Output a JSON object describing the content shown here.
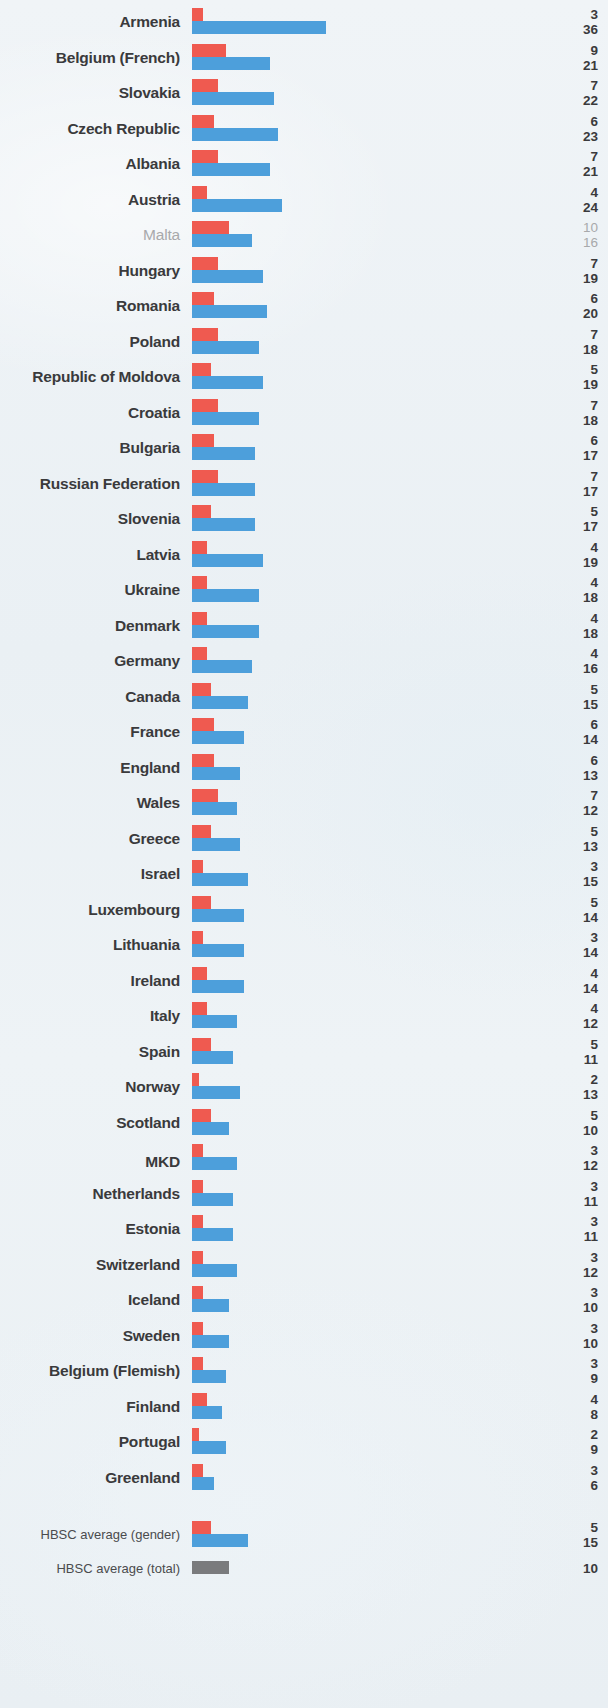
{
  "chart_data": {
    "type": "bar",
    "orientation": "horizontal",
    "title": "",
    "subtitle": "",
    "xlabel": "",
    "ylabel": "",
    "grid": false,
    "legend_position": "none",
    "series": [
      {
        "name": "boys",
        "color": "#ef5a50"
      },
      {
        "name": "girls",
        "color": "#4d9fdb"
      },
      {
        "name": "total",
        "color": "#7a7b7d"
      }
    ],
    "value_unit": "%",
    "xlim": [
      0,
      36
    ],
    "px_per_unit": 3.73,
    "categories": [
      "Armenia",
      "Belgium (French)",
      "Slovakia",
      "Czech Republic",
      "Albania",
      "Austria",
      "Malta",
      "Hungary",
      "Romania",
      "Poland",
      "Republic of Moldova",
      "Croatia",
      "Bulgaria",
      "Russian Federation",
      "Slovenia",
      "Latvia",
      "Ukraine",
      "Denmark",
      "Germany",
      "Canada",
      "France",
      "England",
      "Wales",
      "Greece",
      "Israel",
      "Luxembourg",
      "Lithuania",
      "Ireland",
      "Italy",
      "Spain",
      "Norway",
      "Scotland",
      "MKD",
      "Netherlands",
      "Estonia",
      "Switzerland",
      "Iceland",
      "Sweden",
      "Belgium (Flemish)",
      "Finland",
      "Portugal",
      "Greenland",
      "HBSC average (gender)",
      "HBSC average (total)"
    ],
    "boys": [
      3,
      9,
      7,
      6,
      7,
      4,
      10,
      7,
      6,
      7,
      5,
      7,
      6,
      7,
      5,
      4,
      4,
      4,
      4,
      5,
      6,
      6,
      7,
      5,
      3,
      5,
      3,
      4,
      4,
      5,
      2,
      5,
      3,
      3,
      3,
      3,
      3,
      3,
      3,
      4,
      2,
      3,
      5,
      null
    ],
    "girls": [
      36,
      21,
      22,
      23,
      21,
      24,
      16,
      19,
      20,
      18,
      19,
      18,
      17,
      17,
      17,
      19,
      18,
      18,
      16,
      15,
      14,
      13,
      12,
      13,
      15,
      14,
      14,
      14,
      12,
      11,
      13,
      10,
      12,
      11,
      11,
      12,
      10,
      10,
      9,
      8,
      9,
      6,
      15,
      null
    ],
    "total": [
      null,
      null,
      null,
      null,
      null,
      null,
      null,
      null,
      null,
      null,
      null,
      null,
      null,
      null,
      null,
      null,
      null,
      null,
      null,
      null,
      null,
      null,
      null,
      null,
      null,
      null,
      null,
      null,
      null,
      null,
      null,
      null,
      null,
      null,
      null,
      null,
      null,
      null,
      null,
      null,
      null,
      null,
      null,
      10
    ]
  },
  "rows": [
    {
      "label": "Armenia",
      "boys": "3",
      "girls": "36",
      "style": "normal"
    },
    {
      "label": "Belgium (French)",
      "boys": "9",
      "girls": "21",
      "style": "normal"
    },
    {
      "label": "Slovakia",
      "boys": "7",
      "girls": "22",
      "style": "normal"
    },
    {
      "label": "Czech Republic",
      "boys": "6",
      "girls": "23",
      "style": "normal"
    },
    {
      "label": "Albania",
      "boys": "7",
      "girls": "21",
      "style": "normal"
    },
    {
      "label": "Austria",
      "boys": "4",
      "girls": "24",
      "style": "normal"
    },
    {
      "label": "Malta",
      "boys": "10",
      "girls": "16",
      "style": "dim"
    },
    {
      "label": "Hungary",
      "boys": "7",
      "girls": "19",
      "style": "normal"
    },
    {
      "label": "Romania",
      "boys": "6",
      "girls": "20",
      "style": "normal"
    },
    {
      "label": "Poland",
      "boys": "7",
      "girls": "18",
      "style": "normal"
    },
    {
      "label": "Republic of Moldova",
      "boys": "5",
      "girls": "19",
      "style": "normal"
    },
    {
      "label": "Croatia",
      "boys": "7",
      "girls": "18",
      "style": "normal"
    },
    {
      "label": "Bulgaria",
      "boys": "6",
      "girls": "17",
      "style": "normal"
    },
    {
      "label": "Russian Federation",
      "boys": "7",
      "girls": "17",
      "style": "normal"
    },
    {
      "label": "Slovenia",
      "boys": "5",
      "girls": "17",
      "style": "normal"
    },
    {
      "label": "Latvia",
      "boys": "4",
      "girls": "19",
      "style": "normal"
    },
    {
      "label": "Ukraine",
      "boys": "4",
      "girls": "18",
      "style": "normal"
    },
    {
      "label": "Denmark",
      "boys": "4",
      "girls": "18",
      "style": "normal"
    },
    {
      "label": "Germany",
      "boys": "4",
      "girls": "16",
      "style": "normal"
    },
    {
      "label": "Canada",
      "boys": "5",
      "girls": "15",
      "style": "normal"
    },
    {
      "label": "France",
      "boys": "6",
      "girls": "14",
      "style": "normal"
    },
    {
      "label": "England",
      "boys": "6",
      "girls": "13",
      "style": "normal"
    },
    {
      "label": "Wales",
      "boys": "7",
      "girls": "12",
      "style": "normal"
    },
    {
      "label": "Greece",
      "boys": "5",
      "girls": "13",
      "style": "normal"
    },
    {
      "label": "Israel",
      "boys": "3",
      "girls": "15",
      "style": "normal"
    },
    {
      "label": "Luxembourg",
      "boys": "5",
      "girls": "14",
      "style": "normal"
    },
    {
      "label": "Lithuania",
      "boys": "3",
      "girls": "14",
      "style": "normal"
    },
    {
      "label": "Ireland",
      "boys": "4",
      "girls": "14",
      "style": "normal"
    },
    {
      "label": "Italy",
      "boys": "4",
      "girls": "12",
      "style": "normal"
    },
    {
      "label": "Spain",
      "boys": "5",
      "girls": "11",
      "style": "normal"
    },
    {
      "label": "Norway",
      "boys": "2",
      "girls": "13",
      "style": "normal"
    },
    {
      "label": "Scotland",
      "boys": "5",
      "girls": "10",
      "style": "normal"
    },
    {
      "label": "MKD",
      "boys": "3",
      "girls": "12",
      "style": "normal",
      "superscript": "a"
    },
    {
      "label": "Netherlands",
      "boys": "3",
      "girls": "11",
      "style": "normal"
    },
    {
      "label": "Estonia",
      "boys": "3",
      "girls": "11",
      "style": "normal"
    },
    {
      "label": "Switzerland",
      "boys": "3",
      "girls": "12",
      "style": "normal"
    },
    {
      "label": "Iceland",
      "boys": "3",
      "girls": "10",
      "style": "normal"
    },
    {
      "label": "Sweden",
      "boys": "3",
      "girls": "10",
      "style": "normal"
    },
    {
      "label": "Belgium (Flemish)",
      "boys": "3",
      "girls": "9",
      "style": "normal"
    },
    {
      "label": "Finland",
      "boys": "4",
      "girls": "8",
      "style": "normal"
    },
    {
      "label": "Portugal",
      "boys": "2",
      "girls": "9",
      "style": "normal"
    },
    {
      "label": "Greenland",
      "boys": "3",
      "girls": "6",
      "style": "normal"
    },
    {
      "label": "HBSC average (gender)",
      "boys": "5",
      "girls": "15",
      "style": "avg"
    },
    {
      "label": "HBSC average (total)",
      "total": "10",
      "style": "avg-total"
    }
  ]
}
